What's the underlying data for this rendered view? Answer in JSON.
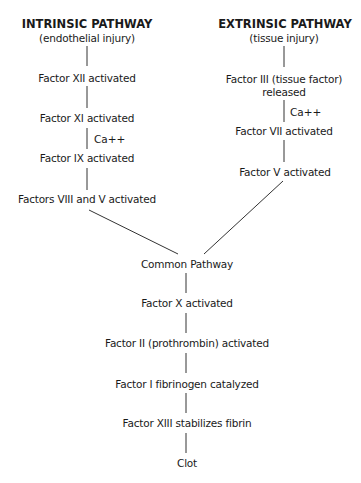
{
  "diagram": {
    "intrinsic": {
      "title": "INTRINSIC PATHWAY",
      "subtitle": "(endothelial injury)",
      "steps": [
        "Factor XII activated",
        "Factor XI activated",
        "Factor IX activated",
        "Factors VIII and V activated"
      ],
      "cofactor_label": "Ca++"
    },
    "extrinsic": {
      "title": "EXTRINSIC PATHWAY",
      "subtitle": "(tissue injury)",
      "steps": [
        "Factor III (tissue factor)",
        "released",
        "Factor VII activated",
        "Factor V activated"
      ],
      "cofactor_label": "Ca++"
    },
    "common": {
      "steps": [
        "Common Pathway",
        "Factor X activated",
        "Factor II (prothrombin) activated",
        "Factor I fibrinogen catalyzed",
        "Factor XIII stabilizes fibrin",
        "Clot"
      ]
    }
  }
}
